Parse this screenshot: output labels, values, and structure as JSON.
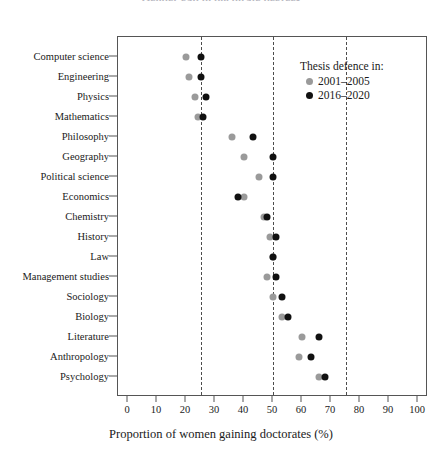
{
  "chart_data": {
    "type": "scatter",
    "title": "Gender gap in doctorate degrees",
    "xlabel": "Proportion of women gaining doctorates (%)",
    "ylabel": "",
    "xlim": [
      0,
      100
    ],
    "xticks": [
      0,
      10,
      20,
      30,
      40,
      50,
      60,
      70,
      80,
      90,
      100
    ],
    "gridlines_x": [
      25,
      50,
      75
    ],
    "grid": "dashed vertical reference lines at 25, 50 and 75",
    "legend_position": "upper right inside plot",
    "categories": [
      "Computer science",
      "Engineering",
      "Physics",
      "Mathematics",
      "Philosophy",
      "Geography",
      "Political science",
      "Economics",
      "Chemistry",
      "History",
      "Law",
      "Management studies",
      "Sociology",
      "Biology",
      "Literature",
      "Anthropology",
      "Psychology"
    ],
    "series": [
      {
        "name": "2001–2005",
        "color": "#9a9a9a",
        "values": [
          20,
          21,
          23,
          24,
          36,
          40,
          45,
          40,
          47,
          49,
          50,
          48,
          50,
          53,
          60,
          59,
          66
        ]
      },
      {
        "name": "2016–2020",
        "color": "#111111",
        "values": [
          25,
          25,
          27,
          26,
          43,
          50,
          50,
          38,
          48,
          51,
          50,
          51,
          53,
          55,
          66,
          63,
          68
        ]
      }
    ]
  },
  "legend": {
    "title": "Thesis defence in:",
    "entries": [
      {
        "label": "2001–2005",
        "swatch": "gray-dot"
      },
      {
        "label": "2016–2020",
        "swatch": "black-dot"
      }
    ]
  },
  "axis": {
    "x_title": "Proportion of women gaining doctorates (%)"
  }
}
